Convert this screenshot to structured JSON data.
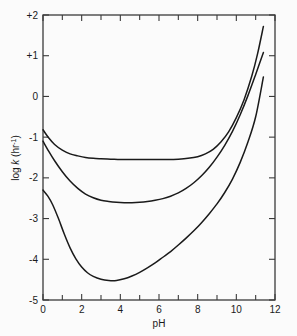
{
  "figure": {
    "cut_title_fragment": "",
    "background_color": "#fbfbfb",
    "line_color": "#1a1a1a",
    "axis_color": "#3a3a3a"
  },
  "chart_data": {
    "type": "line",
    "title": "",
    "xlabel": "pH",
    "ylabel": "log k (hr-1)",
    "ylabel_parts": {
      "prefix": "log ",
      "italic": "k",
      "unit_open": " (hr",
      "unit_exp": "-1",
      "unit_close": ")"
    },
    "xlim": [
      0,
      12
    ],
    "ylim": [
      -5,
      2
    ],
    "grid": false,
    "legend": null,
    "x_ticks_major": [
      0,
      2,
      4,
      6,
      8,
      10,
      12
    ],
    "x_ticks_minor": [
      1,
      3,
      5,
      7,
      9,
      11
    ],
    "x_tick_labels": [
      "0",
      "2",
      "4",
      "6",
      "8",
      "10",
      "12"
    ],
    "y_ticks_major": [
      -5,
      -4,
      -3,
      -2,
      -1,
      0,
      1,
      2
    ],
    "y_tick_labels": [
      "-5",
      "-4",
      "-3",
      "-2",
      "-1",
      "0",
      "+1",
      "+2"
    ],
    "series": [
      {
        "name": "upper curve",
        "x": [
          0.0,
          0.3,
          0.6,
          1.0,
          1.4,
          1.8,
          2.2,
          2.6,
          3.0,
          3.5,
          4.0,
          4.5,
          5.0,
          5.5,
          6.0,
          6.5,
          7.0,
          7.5,
          8.0,
          8.4,
          8.8,
          9.2,
          9.6,
          10.0,
          10.4,
          10.8,
          11.1,
          11.4
        ],
        "y": [
          -0.82,
          -1.02,
          -1.18,
          -1.32,
          -1.41,
          -1.46,
          -1.5,
          -1.52,
          -1.53,
          -1.54,
          -1.55,
          -1.55,
          -1.55,
          -1.55,
          -1.55,
          -1.55,
          -1.54,
          -1.52,
          -1.48,
          -1.41,
          -1.3,
          -1.12,
          -0.87,
          -0.52,
          -0.08,
          0.5,
          1.05,
          1.72
        ]
      },
      {
        "name": "middle curve",
        "x": [
          0.0,
          0.3,
          0.6,
          1.0,
          1.4,
          1.8,
          2.2,
          2.6,
          3.0,
          3.4,
          3.8,
          4.2,
          4.6,
          5.0,
          5.4,
          5.8,
          6.2,
          6.6,
          7.0,
          7.4,
          7.8,
          8.2,
          8.6,
          9.0,
          9.4,
          9.8,
          10.2,
          10.6,
          11.0,
          11.4
        ],
        "y": [
          -1.1,
          -1.35,
          -1.58,
          -1.85,
          -2.08,
          -2.26,
          -2.4,
          -2.49,
          -2.55,
          -2.58,
          -2.6,
          -2.61,
          -2.61,
          -2.6,
          -2.58,
          -2.55,
          -2.51,
          -2.45,
          -2.37,
          -2.26,
          -2.12,
          -1.95,
          -1.74,
          -1.49,
          -1.2,
          -0.86,
          -0.45,
          0.02,
          0.54,
          1.08
        ]
      },
      {
        "name": "lower curve",
        "x": [
          0.0,
          0.25,
          0.5,
          0.8,
          1.1,
          1.4,
          1.7,
          2.0,
          2.3,
          2.6,
          3.0,
          3.4,
          3.8,
          4.2,
          4.6,
          5.0,
          5.4,
          5.8,
          6.2,
          6.6,
          7.0,
          7.4,
          7.8,
          8.2,
          8.6,
          9.0,
          9.4,
          9.8,
          10.2,
          10.6,
          11.0,
          11.4
        ],
        "y": [
          -2.3,
          -2.45,
          -2.66,
          -3.0,
          -3.38,
          -3.72,
          -3.99,
          -4.19,
          -4.33,
          -4.42,
          -4.49,
          -4.52,
          -4.52,
          -4.48,
          -4.41,
          -4.32,
          -4.21,
          -4.09,
          -3.95,
          -3.81,
          -3.65,
          -3.48,
          -3.3,
          -3.1,
          -2.88,
          -2.64,
          -2.36,
          -2.03,
          -1.62,
          -1.12,
          -0.5,
          0.48
        ]
      }
    ],
    "annotations": []
  }
}
